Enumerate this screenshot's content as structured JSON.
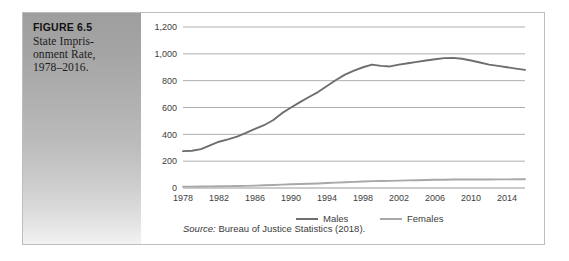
{
  "figure": {
    "label": "FIGURE 6.5",
    "title_lines": [
      "State Impris-",
      "onment Rate,",
      "1978–2016."
    ],
    "title_full": "State Imprisonment Rate, 1978–2016."
  },
  "source": {
    "prefix": "Source:",
    "text": " Bureau of Justice Statistics (2018)."
  },
  "colors": {
    "males_line": "#6e6e6e",
    "females_line": "#a8a8a8",
    "gridline": "#8c8c8c",
    "panel_dark": "#9e9e9e",
    "panel_light": "#f2f2f2",
    "border": "#bdbdbd",
    "tick_text": "#3d3d3d"
  },
  "chart_data": {
    "type": "line",
    "xlabel": "",
    "ylabel": "",
    "ylim": [
      0,
      1200
    ],
    "yticks": [
      0,
      200,
      400,
      600,
      800,
      1000,
      1200
    ],
    "ytick_labels": [
      "0",
      "200",
      "400",
      "600",
      "800",
      "1,000",
      "1,200"
    ],
    "xlim": [
      1978,
      2016
    ],
    "xticks": [
      1978,
      1982,
      1986,
      1990,
      1994,
      1998,
      2002,
      2006,
      2010,
      2014
    ],
    "xtick_labels": [
      "1978",
      "1982",
      "1986",
      "1990",
      "1994",
      "1998",
      "2002",
      "2006",
      "2010",
      "2014"
    ],
    "grid": true,
    "grid_axis": "y",
    "legend": [
      "Males",
      "Females"
    ],
    "legend_position": "bottom",
    "x": [
      1978,
      1979,
      1980,
      1981,
      1982,
      1983,
      1984,
      1985,
      1986,
      1987,
      1988,
      1989,
      1990,
      1991,
      1992,
      1993,
      1994,
      1995,
      1996,
      1997,
      1998,
      1999,
      2000,
      2001,
      2002,
      2003,
      2004,
      2005,
      2006,
      2007,
      2008,
      2009,
      2010,
      2011,
      2012,
      2013,
      2014,
      2015,
      2016
    ],
    "series": [
      {
        "name": "Males",
        "color": "#6e6e6e",
        "values": [
          275,
          278,
          290,
          318,
          345,
          363,
          383,
          410,
          440,
          468,
          505,
          558,
          600,
          640,
          678,
          715,
          760,
          805,
          845,
          875,
          900,
          920,
          910,
          906,
          920,
          930,
          940,
          950,
          960,
          968,
          970,
          963,
          950,
          935,
          920,
          910,
          900,
          890,
          880
        ]
      },
      {
        "name": "Females",
        "color": "#a8a8a8",
        "values": [
          10,
          10,
          11,
          12,
          13,
          14,
          15,
          16,
          18,
          20,
          22,
          25,
          28,
          30,
          32,
          34,
          37,
          40,
          43,
          46,
          49,
          51,
          52,
          53,
          55,
          57,
          58,
          60,
          61,
          62,
          63,
          63,
          63,
          63,
          63,
          64,
          64,
          65,
          65
        ]
      }
    ]
  }
}
